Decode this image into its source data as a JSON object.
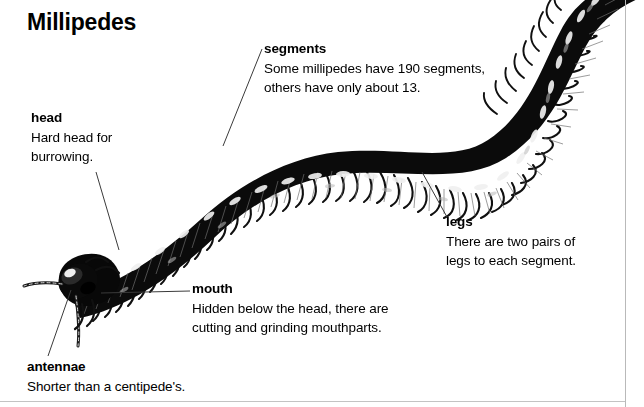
{
  "page": {
    "title": "Millipedes",
    "background_color": "#ffffff",
    "text_color": "#000000",
    "rule_color": "#b9b9b9",
    "width": 644,
    "height": 407
  },
  "illustration": {
    "name": "millipede-illustration",
    "subject": "millipede",
    "description": "Black-and-white engraved illustration of a millipede with a long segmented body curving from the lower left head across to the upper right, with many pairs of legs beneath each segment.",
    "body_color": "#111111",
    "highlight_color": "#f2f2f2"
  },
  "callouts": [
    {
      "id": "segments",
      "term": "segments",
      "body": "Some millipedes have 190 segments,\nothers have only about 13."
    },
    {
      "id": "head",
      "term": "head",
      "body": "Hard head for\nburrowing."
    },
    {
      "id": "legs",
      "term": "legs",
      "body": "There are two pairs of\nlegs to each segment."
    },
    {
      "id": "mouth",
      "term": "mouth",
      "body": "Hidden below the head, there are\ncutting and grinding mouthparts."
    },
    {
      "id": "antennae",
      "term": "antennae",
      "body": "Shorter than a centipede's."
    }
  ]
}
